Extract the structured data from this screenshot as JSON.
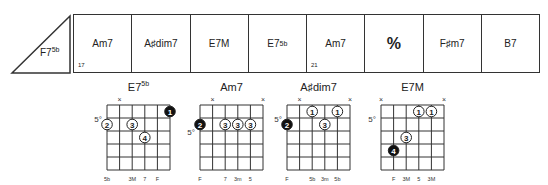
{
  "lead_in": {
    "chord": "F7",
    "alteration": "5b"
  },
  "measures": [
    {
      "chord": "Am7",
      "alteration": "",
      "number": "17"
    },
    {
      "chord": "A♯dim7",
      "alteration": "",
      "number": ""
    },
    {
      "chord": "E7M",
      "alteration": "",
      "number": ""
    },
    {
      "chord": "E7",
      "alteration": "5b",
      "number": ""
    },
    {
      "chord": "Am7",
      "alteration": "",
      "number": "21"
    },
    {
      "chord": "%",
      "alteration": "",
      "number": "",
      "type": "repeat-sign"
    },
    {
      "chord": "F♯m7",
      "alteration": "",
      "number": ""
    },
    {
      "chord": "B7",
      "alteration": "",
      "number": ""
    }
  ],
  "chord_diagrams": [
    {
      "name": "E7",
      "alteration": "5b",
      "fret_label": "5°",
      "fret_label_row": 1,
      "muted_strings": [
        1,
        6
      ],
      "dots": [
        {
          "string": 5,
          "fret": 1,
          "finger": "1",
          "filled": true
        },
        {
          "string": 0,
          "fret": 2,
          "finger": "2",
          "filled": false
        },
        {
          "string": 2,
          "fret": 2,
          "finger": "3",
          "filled": false
        },
        {
          "string": 3,
          "fret": 3,
          "finger": "4",
          "filled": false
        }
      ],
      "bottom_labels": [
        {
          "string": 0,
          "text": "5b"
        },
        {
          "string": 2,
          "text": "3M"
        },
        {
          "string": 3,
          "text": "7"
        },
        {
          "string": 4,
          "text": "F"
        }
      ]
    },
    {
      "name": "Am7",
      "alteration": "",
      "fret_label": "5°",
      "fret_label_row": 2,
      "muted_strings": [
        1,
        5
      ],
      "dots": [
        {
          "string": 0,
          "fret": 2,
          "finger": "2",
          "filled": true
        },
        {
          "string": 2,
          "fret": 2,
          "finger": "3",
          "filled": false
        },
        {
          "string": 3,
          "fret": 2,
          "finger": "3",
          "filled": false
        },
        {
          "string": 4,
          "fret": 2,
          "finger": "3",
          "filled": false
        }
      ],
      "bottom_labels": [
        {
          "string": 0,
          "text": "F"
        },
        {
          "string": 2,
          "text": "7"
        },
        {
          "string": 3,
          "text": "3m"
        },
        {
          "string": 4,
          "text": "5"
        }
      ]
    },
    {
      "name": "A♯dim7",
      "alteration": "",
      "fret_label": "5°",
      "fret_label_row": 1,
      "muted_strings": [
        1,
        5
      ],
      "dots": [
        {
          "string": 0,
          "fret": 2,
          "finger": "2",
          "filled": true
        },
        {
          "string": 2,
          "fret": 1,
          "finger": "1",
          "filled": false
        },
        {
          "string": 4,
          "fret": 1,
          "finger": "1",
          "filled": false
        },
        {
          "string": 3,
          "fret": 2,
          "finger": "3",
          "filled": false
        }
      ],
      "bottom_labels": [
        {
          "string": 0,
          "text": "F"
        },
        {
          "string": 2,
          "text": "5b"
        },
        {
          "string": 3,
          "text": "3m"
        },
        {
          "string": 4,
          "text": "5b"
        }
      ]
    },
    {
      "name": "E7M",
      "alteration": "",
      "fret_label": "5°",
      "fret_label_row": 1,
      "muted_strings": [
        0,
        5
      ],
      "dots": [
        {
          "string": 3,
          "fret": 1,
          "finger": "1",
          "filled": false
        },
        {
          "string": 4,
          "fret": 1,
          "finger": "1",
          "filled": false
        },
        {
          "string": 2,
          "fret": 3,
          "finger": "3",
          "filled": false
        },
        {
          "string": 1,
          "fret": 4,
          "finger": "4",
          "filled": true
        }
      ],
      "bottom_labels": [
        {
          "string": 1,
          "text": "F"
        },
        {
          "string": 2,
          "text": "3M"
        },
        {
          "string": 3,
          "text": "5"
        },
        {
          "string": 4,
          "text": "3M"
        }
      ]
    }
  ]
}
